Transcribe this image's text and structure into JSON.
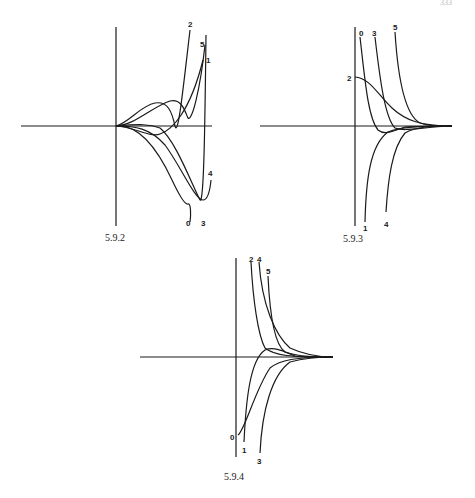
{
  "page": {
    "page_number_fragment": "333"
  },
  "figures": [
    {
      "id": "fig-5-9-2",
      "caption": "5.9.2",
      "curve_labels": [
        "0",
        "1",
        "2",
        "3",
        "4",
        "5"
      ]
    },
    {
      "id": "fig-5-9-3",
      "caption": "5.9.3",
      "curve_labels": [
        "0",
        "1",
        "2",
        "3",
        "4",
        "5"
      ]
    },
    {
      "id": "fig-5-9-4",
      "caption": "5.9.4",
      "curve_labels": [
        "0",
        "1",
        "2",
        "3",
        "4",
        "5"
      ]
    }
  ]
}
